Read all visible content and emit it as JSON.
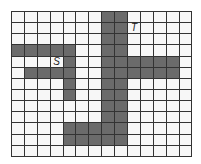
{
  "grid": {
    "cols": 14,
    "rows": 13,
    "shaded_color": "#6b6b6b",
    "empty_color": "#f7f7f7",
    "shaded": [
      [
        0,
        7
      ],
      [
        0,
        8
      ],
      [
        1,
        7
      ],
      [
        1,
        8
      ],
      [
        2,
        7
      ],
      [
        2,
        8
      ],
      [
        3,
        0
      ],
      [
        3,
        1
      ],
      [
        3,
        2
      ],
      [
        3,
        3
      ],
      [
        3,
        4
      ],
      [
        3,
        7
      ],
      [
        3,
        8
      ],
      [
        4,
        4
      ],
      [
        4,
        7
      ],
      [
        4,
        8
      ],
      [
        4,
        9
      ],
      [
        4,
        10
      ],
      [
        4,
        11
      ],
      [
        4,
        12
      ],
      [
        5,
        1
      ],
      [
        5,
        2
      ],
      [
        5,
        3
      ],
      [
        5,
        4
      ],
      [
        5,
        7
      ],
      [
        5,
        8
      ],
      [
        5,
        9
      ],
      [
        5,
        10
      ],
      [
        5,
        11
      ],
      [
        5,
        12
      ],
      [
        6,
        4
      ],
      [
        6,
        7
      ],
      [
        6,
        8
      ],
      [
        7,
        4
      ],
      [
        7,
        7
      ],
      [
        7,
        8
      ],
      [
        8,
        7
      ],
      [
        8,
        8
      ],
      [
        9,
        7
      ],
      [
        9,
        8
      ],
      [
        10,
        4
      ],
      [
        10,
        5
      ],
      [
        10,
        6
      ],
      [
        10,
        7
      ],
      [
        10,
        8
      ],
      [
        11,
        4
      ],
      [
        11,
        5
      ],
      [
        11,
        6
      ],
      [
        11,
        7
      ],
      [
        11,
        8
      ]
    ],
    "labels": [
      {
        "text": "S",
        "row": 4,
        "col": 3
      },
      {
        "text": "T",
        "row": 1,
        "col": 9
      }
    ]
  }
}
